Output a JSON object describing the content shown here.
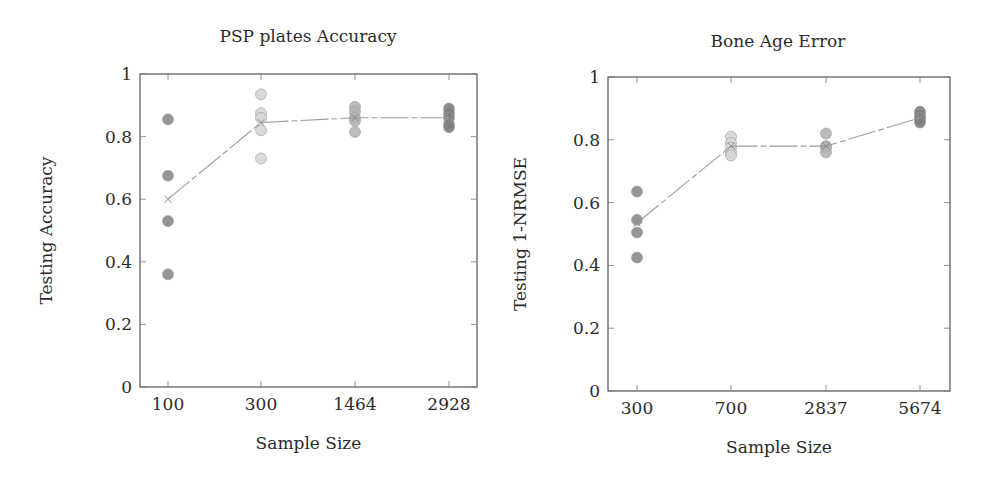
{
  "chart_data": [
    {
      "type": "scatter",
      "title": "PSP plates Accuracy",
      "xlabel": "Sample Size",
      "ylabel": "Testing Accuracy",
      "ylim": [
        0,
        1
      ],
      "yticks": [
        "0",
        "0.2",
        "0.4",
        "0.6",
        "0.8",
        "1"
      ],
      "categories": [
        "100",
        "300",
        "1464",
        "2928"
      ],
      "points": [
        [
          0.855,
          0.675,
          0.53,
          0.36
        ],
        [
          0.935,
          0.875,
          0.86,
          0.82,
          0.73
        ],
        [
          0.895,
          0.88,
          0.86,
          0.85,
          0.815
        ],
        [
          0.89,
          0.875,
          0.86,
          0.84,
          0.83
        ]
      ],
      "mean_line": [
        0.6,
        0.845,
        0.86,
        0.86
      ],
      "marker_colors": [
        "#8a8a8a",
        "#d6d6d6",
        "#b4b4b4",
        "#7e7e7e"
      ],
      "grid": false
    },
    {
      "type": "scatter",
      "title": "Bone Age Error",
      "xlabel": "Sample Size",
      "ylabel": "Testing 1-NRMSE",
      "ylim": [
        0,
        1
      ],
      "yticks": [
        "0",
        "0.2",
        "0.4",
        "0.6",
        "0.8",
        "1"
      ],
      "categories": [
        "300",
        "700",
        "2837",
        "5674"
      ],
      "points": [
        [
          0.635,
          0.545,
          0.505,
          0.425
        ],
        [
          0.81,
          0.79,
          0.775,
          0.76,
          0.75
        ],
        [
          0.82,
          0.78,
          0.775,
          0.76
        ],
        [
          0.89,
          0.88,
          0.87,
          0.865,
          0.855
        ]
      ],
      "mean_line": [
        0.535,
        0.78,
        0.78,
        0.87
      ],
      "marker_colors": [
        "#8a8a8a",
        "#d6d6d6",
        "#b4b4b4",
        "#7e7e7e"
      ],
      "grid": false
    }
  ]
}
